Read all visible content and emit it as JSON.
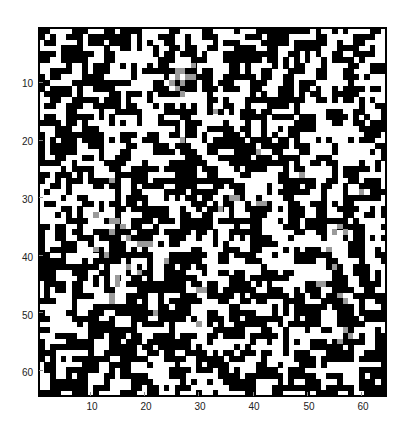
{
  "chart_data": {
    "type": "heatmap",
    "title": "",
    "xlabel": "",
    "ylabel": "",
    "rows": 64,
    "cols": 64,
    "colormap": [
      "#ffffff",
      "#000000"
    ],
    "grey_color": "#9a9a9a",
    "xlim": [
      0.5,
      64.5
    ],
    "ylim": [
      0.5,
      64.5
    ],
    "y_direction": "reverse",
    "grid": false,
    "x_ticks": [
      10,
      20,
      30,
      40,
      50,
      60
    ],
    "y_ticks": [
      10,
      20,
      30,
      40,
      50,
      60
    ],
    "x_tick_labels": [
      "10",
      "20",
      "30",
      "40",
      "50",
      "60"
    ],
    "y_tick_labels": [
      "10",
      "20",
      "30",
      "40",
      "50",
      "60"
    ],
    "density_black": 0.5,
    "seed": 1337,
    "grey_cells": [
      [
        8,
        26
      ],
      [
        8,
        27
      ],
      [
        9,
        26
      ],
      [
        9,
        28
      ],
      [
        9,
        29
      ],
      [
        10,
        25
      ],
      [
        10,
        27
      ],
      [
        11,
        26
      ],
      [
        12,
        27
      ],
      [
        7,
        29
      ],
      [
        27,
        14
      ],
      [
        30,
        37
      ],
      [
        30,
        36
      ],
      [
        31,
        41
      ],
      [
        32,
        34
      ],
      [
        33,
        11
      ],
      [
        34,
        14
      ],
      [
        34,
        15
      ],
      [
        35,
        16
      ],
      [
        36,
        14
      ],
      [
        37,
        17
      ],
      [
        38,
        19
      ],
      [
        38,
        20
      ],
      [
        38,
        21
      ],
      [
        39,
        11
      ],
      [
        40,
        13
      ],
      [
        41,
        24
      ],
      [
        42,
        17
      ],
      [
        43,
        19
      ],
      [
        44,
        15
      ],
      [
        45,
        15
      ],
      [
        46,
        30
      ],
      [
        46,
        31
      ],
      [
        47,
        14
      ],
      [
        48,
        14
      ],
      [
        35,
        56
      ],
      [
        36,
        55
      ],
      [
        36,
        57
      ],
      [
        39,
        54
      ],
      [
        42,
        55
      ],
      [
        45,
        52
      ],
      [
        45,
        53
      ],
      [
        47,
        56
      ],
      [
        48,
        57
      ],
      [
        26,
        49
      ],
      [
        29,
        60
      ],
      [
        31,
        42
      ],
      [
        53,
        57
      ],
      [
        54,
        58
      ],
      [
        55,
        56
      ],
      [
        20,
        27
      ],
      [
        22,
        41
      ],
      [
        15,
        33
      ],
      [
        50,
        22
      ],
      [
        52,
        30
      ]
    ]
  },
  "axes": {
    "plot_left": 39,
    "plot_top": 28,
    "plot_width": 347,
    "plot_height": 368
  }
}
